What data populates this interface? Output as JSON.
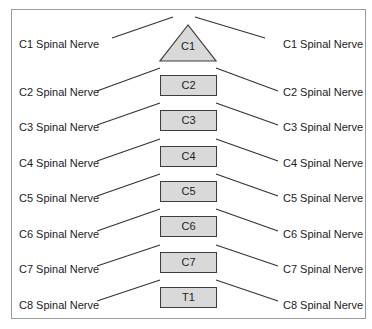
{
  "diagram": {
    "type": "spinal-nerve-vertebrae",
    "vertebrae": [
      {
        "label": "C1",
        "shape": "triangle"
      },
      {
        "label": "C2",
        "shape": "box"
      },
      {
        "label": "C3",
        "shape": "box"
      },
      {
        "label": "C4",
        "shape": "box"
      },
      {
        "label": "C5",
        "shape": "box"
      },
      {
        "label": "C6",
        "shape": "box"
      },
      {
        "label": "C7",
        "shape": "box"
      },
      {
        "label": "T1",
        "shape": "box"
      }
    ],
    "nerves_left": [
      "C1 Spinal Nerve",
      "C2 Spinal Nerve",
      "C3 Spinal Nerve",
      "C4 Spinal Nerve",
      "C5 Spinal Nerve",
      "C6 Spinal Nerve",
      "C7 Spinal Nerve",
      "C8 Spinal Nerve"
    ],
    "nerves_right": [
      "C1 Spinal Nerve",
      "C2 Spinal Nerve",
      "C3 Spinal Nerve",
      "C4 Spinal Nerve",
      "C5 Spinal Nerve",
      "C6 Spinal Nerve",
      "C7 Spinal Nerve",
      "C8 Spinal Nerve"
    ],
    "colors": {
      "vertebra_fill": "#d9d9d9",
      "vertebra_stroke": "#3c3c3c",
      "line": "#333333",
      "frame": "#9a9a9a"
    }
  }
}
